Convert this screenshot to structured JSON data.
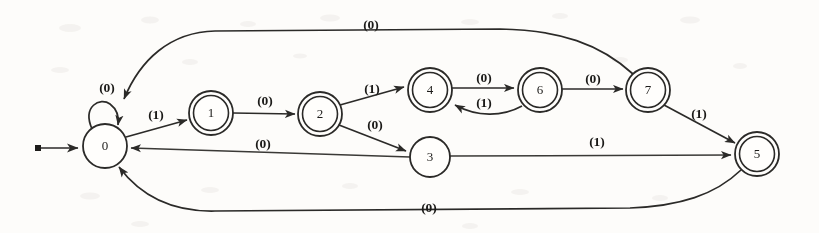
{
  "diagram": {
    "type": "state-machine",
    "alphabet": [
      "0",
      "1"
    ],
    "start_state": "0",
    "accepting_states": [
      "1",
      "2",
      "4",
      "5",
      "6",
      "7"
    ],
    "stroke_color": "#2b2a28",
    "background_color": "#fdfcfa"
  },
  "states": [
    {
      "id": "s0",
      "label": "0",
      "x": 105,
      "y": 146,
      "r": 22,
      "accepting": false,
      "start": true
    },
    {
      "id": "s1",
      "label": "1",
      "x": 211,
      "y": 113,
      "r": 22,
      "accepting": true,
      "start": false
    },
    {
      "id": "s2",
      "label": "2",
      "x": 320,
      "y": 114,
      "r": 22,
      "accepting": true,
      "start": false
    },
    {
      "id": "s3",
      "label": "3",
      "x": 430,
      "y": 157,
      "r": 20,
      "accepting": false,
      "start": false
    },
    {
      "id": "s4",
      "label": "4",
      "x": 430,
      "y": 90,
      "r": 22,
      "accepting": true,
      "start": false
    },
    {
      "id": "s5",
      "label": "5",
      "x": 757,
      "y": 154,
      "r": 22,
      "accepting": true,
      "start": false
    },
    {
      "id": "s6",
      "label": "6",
      "x": 540,
      "y": 90,
      "r": 22,
      "accepting": true,
      "start": false
    },
    {
      "id": "s7",
      "label": "7",
      "x": 648,
      "y": 90,
      "r": 22,
      "accepting": true,
      "start": false
    }
  ],
  "transitions": [
    {
      "id": "t0-0",
      "from": "0",
      "to": "0",
      "symbol": "(0)",
      "label_x": 107,
      "label_y": 89
    },
    {
      "id": "t0-1",
      "from": "0",
      "to": "1",
      "symbol": "(1)",
      "label_x": 156,
      "label_y": 116
    },
    {
      "id": "t1-2",
      "from": "1",
      "to": "2",
      "symbol": "(0)",
      "label_x": 265,
      "label_y": 102
    },
    {
      "id": "t2-4",
      "from": "2",
      "to": "4",
      "symbol": "(1)",
      "label_x": 372,
      "label_y": 90
    },
    {
      "id": "t2-3",
      "from": "2",
      "to": "3",
      "symbol": "(0)",
      "label_x": 375,
      "label_y": 126
    },
    {
      "id": "t3-0",
      "from": "3",
      "to": "0",
      "symbol": "(0)",
      "label_x": 263,
      "label_y": 145
    },
    {
      "id": "t3-5",
      "from": "3",
      "to": "5",
      "symbol": "(1)",
      "label_x": 597,
      "label_y": 143
    },
    {
      "id": "t4-6",
      "from": "4",
      "to": "6",
      "symbol": "(0)",
      "label_x": 484,
      "label_y": 79
    },
    {
      "id": "t6-4",
      "from": "6",
      "to": "4",
      "symbol": "(1)",
      "label_x": 484,
      "label_y": 104
    },
    {
      "id": "t6-7",
      "from": "6",
      "to": "7",
      "symbol": "(0)",
      "label_x": 593,
      "label_y": 80
    },
    {
      "id": "t7-5",
      "from": "7",
      "to": "5",
      "symbol": "(1)",
      "label_x": 699,
      "label_y": 115
    },
    {
      "id": "t7-0",
      "from": "7",
      "to": "0",
      "symbol": "(0)",
      "label_x": 371,
      "label_y": 26
    },
    {
      "id": "t5-0",
      "from": "5",
      "to": "0",
      "symbol": "(0)",
      "label_x": 429,
      "label_y": 209
    }
  ],
  "start_marker": {
    "dot_x": 38,
    "dot_y": 148,
    "arrow_x": 80,
    "arrow_y": 148
  }
}
